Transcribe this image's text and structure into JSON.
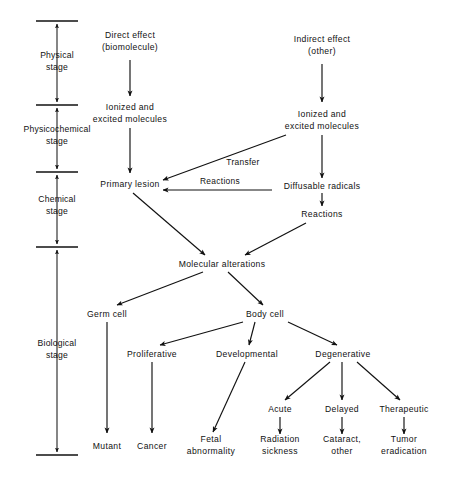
{
  "diagram": {
    "stroke_color": "#111111",
    "background": "#ffffff",
    "stages": [
      {
        "id": "physical",
        "line1": "Physical",
        "line2": "stage"
      },
      {
        "id": "physicochemical",
        "line1": "Physicochemical",
        "line2": "stage"
      },
      {
        "id": "chemical",
        "line1": "Chemical",
        "line2": "stage"
      },
      {
        "id": "biological",
        "line1": "Biological",
        "line2": "stage"
      }
    ],
    "nodes": [
      {
        "id": "direct-effect",
        "line1": "Direct effect",
        "line2": "(biomolecule)"
      },
      {
        "id": "indirect-effect",
        "line1": "Indirect effect",
        "line2": "(other)"
      },
      {
        "id": "ionized-left",
        "line1": "Ionized and",
        "line2": "excited molecules"
      },
      {
        "id": "ionized-right",
        "line1": "Ionized and",
        "line2": "excited molecules"
      },
      {
        "id": "primary-lesion",
        "line1": "Primary  lesion",
        "line2": ""
      },
      {
        "id": "diffusable-radicals",
        "line1": "Diffusable radicals",
        "line2": ""
      },
      {
        "id": "reactions-node",
        "line1": "Reactions",
        "line2": ""
      },
      {
        "id": "molecular-alterations",
        "line1": "Molecular  alterations",
        "line2": ""
      },
      {
        "id": "germ-cell",
        "line1": "Germ  cell",
        "line2": ""
      },
      {
        "id": "body-cell",
        "line1": "Body  cell",
        "line2": ""
      },
      {
        "id": "proliferative",
        "line1": "Proliferative",
        "line2": ""
      },
      {
        "id": "developmental",
        "line1": "Developmental",
        "line2": ""
      },
      {
        "id": "degenerative",
        "line1": "Degenerative",
        "line2": ""
      },
      {
        "id": "acute",
        "line1": "Acute",
        "line2": ""
      },
      {
        "id": "delayed",
        "line1": "Delayed",
        "line2": ""
      },
      {
        "id": "therapeutic",
        "line1": "Therapeutic",
        "line2": ""
      },
      {
        "id": "mutant",
        "line1": "Mutant",
        "line2": ""
      },
      {
        "id": "cancer",
        "line1": "Cancer",
        "line2": ""
      },
      {
        "id": "fetal-abnormality",
        "line1": "Fetal",
        "line2": "abnormality"
      },
      {
        "id": "radiation-sickness",
        "line1": "Radiation",
        "line2": "sickness"
      },
      {
        "id": "cataract-other",
        "line1": "Cataract,",
        "line2": "other"
      },
      {
        "id": "tumor-eradication",
        "line1": "Tumor",
        "line2": "eradication"
      }
    ],
    "edge_labels": [
      {
        "id": "transfer",
        "text": "Transfer"
      },
      {
        "id": "reactions",
        "text": "Reactions"
      }
    ]
  }
}
